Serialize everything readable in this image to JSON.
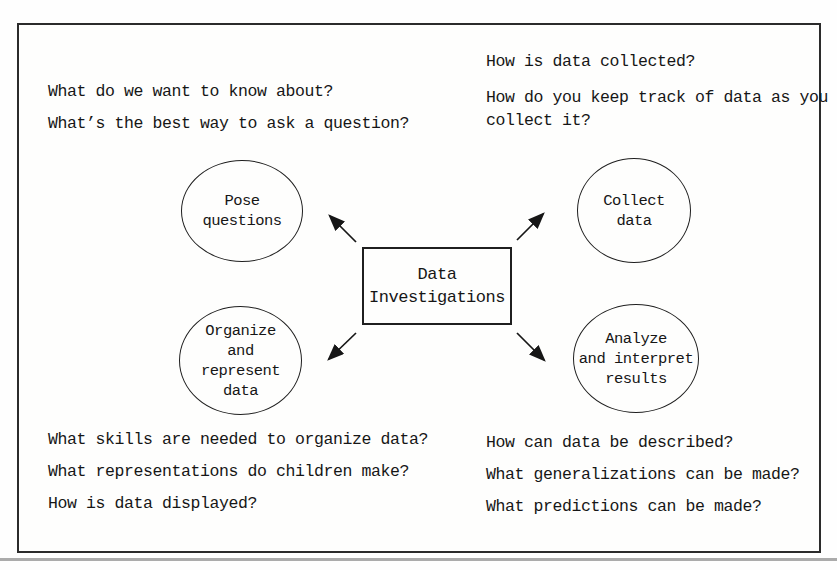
{
  "page": {
    "background": "#fefefe",
    "frame_border_color": "#2b2b2b",
    "text_color": "#161616"
  },
  "center_box": {
    "lines": [
      "Data",
      "Investigations"
    ]
  },
  "nodes": {
    "pose": {
      "lines": [
        "Pose",
        "questions"
      ]
    },
    "collect": {
      "lines": [
        "Collect",
        "data"
      ]
    },
    "organize": {
      "lines": [
        "Organize",
        "and",
        "represent",
        "data"
      ]
    },
    "analyze": {
      "lines": [
        "Analyze",
        "and interpret",
        "results"
      ]
    }
  },
  "questions": {
    "top_left": [
      "What do we want to know about?",
      "What’s the best way to ask a question?"
    ],
    "top_right": [
      "How is data collected?",
      "How do you keep track of data as you collect it?"
    ],
    "bottom_left": [
      "What skills are needed to organize data?",
      "What representations do children make?",
      "How is data displayed?"
    ],
    "bottom_right": [
      "How can data be described?",
      "What generalizations can be made?",
      "What predictions can be made?"
    ]
  }
}
